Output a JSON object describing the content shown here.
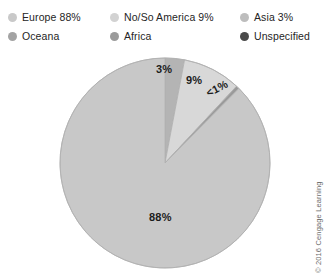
{
  "legend": {
    "rows": [
      [
        {
          "label": "Europe 88%",
          "color": "#c9c9c9",
          "name": "legend-item-europe"
        },
        {
          "label": "No/So America 9%",
          "color": "#d2d2d2",
          "name": "legend-item-no-so-america"
        },
        {
          "label": "Asia 3%",
          "color": "#bdbdbd",
          "name": "legend-item-asia"
        }
      ],
      [
        {
          "label": "Oceana",
          "color": "#a3a3a3",
          "name": "legend-item-oceana"
        },
        {
          "label": "Africa",
          "color": "#9b9b9b",
          "name": "legend-item-africa"
        },
        {
          "label": "Unspecified",
          "color": "#4a4a4a",
          "name": "legend-item-unspecified"
        }
      ]
    ]
  },
  "chart_data": {
    "type": "pie",
    "title": "",
    "categories": [
      "Asia",
      "No/So America",
      "Unspecified",
      "Europe"
    ],
    "values": [
      3,
      9,
      0.5,
      88
    ],
    "data_labels": [
      "3%",
      "9%",
      "<1%",
      "88%"
    ],
    "legend_entries": [
      "Europe 88%",
      "No/So America 9%",
      "Asia 3%",
      "Oceana",
      "Africa",
      "Unspecified"
    ],
    "legend_position": "top",
    "colors": [
      "#b4b4b4",
      "#d8d8d8",
      "#9a9a9a",
      "#c8c8c8"
    ],
    "start_angle_deg": 0,
    "direction": "clockwise",
    "grid": false,
    "xlabel": "",
    "ylabel": ""
  },
  "pie": {
    "center_x": 165,
    "center_y": 163,
    "radius": 105,
    "slices": [
      {
        "name": "slice-asia",
        "label": "3%",
        "value": 3,
        "color": "#b4b4b4"
      },
      {
        "name": "slice-no-so-america",
        "label": "9%",
        "value": 9,
        "color": "#d8d8d8"
      },
      {
        "name": "slice-unspecified",
        "label": "<1%",
        "value": 0.5,
        "color": "#9a9a9a"
      },
      {
        "name": "slice-europe",
        "label": "88%",
        "value": 88,
        "color": "#c8c8c8"
      }
    ],
    "stroke": "#b0b0b0"
  },
  "credit": {
    "text": "© 2016 Cengage Learning"
  }
}
